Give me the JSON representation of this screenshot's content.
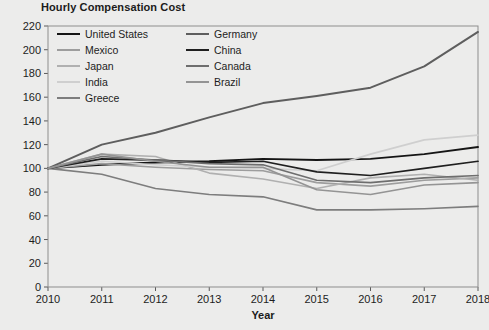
{
  "chart_data": {
    "type": "line",
    "title": "Hourly Compensation Cost",
    "xlabel": "Year",
    "ylabel": "",
    "x": [
      2010,
      2011,
      2012,
      2013,
      2014,
      2015,
      2016,
      2017,
      2018
    ],
    "xticklabels": [
      "2010",
      "2011",
      "2012",
      "2013",
      "2014",
      "2015",
      "2016",
      "2017",
      "2018"
    ],
    "xlim": [
      2010,
      2018
    ],
    "ylim": [
      0,
      220
    ],
    "yticks": [
      0,
      20,
      40,
      60,
      80,
      100,
      120,
      140,
      160,
      180,
      200,
      220
    ],
    "yticklabels": [
      "0",
      "20",
      "40",
      "60",
      "80",
      "100",
      "120",
      "140",
      "160",
      "180",
      "200",
      "220"
    ],
    "grid": false,
    "legend_position": "upper-left-inside",
    "legend_columns": 2,
    "series": [
      {
        "name": "United States",
        "color": "#151515",
        "width": 1.9,
        "values": [
          100,
          103,
          105,
          106,
          108,
          107,
          108,
          112,
          118
        ]
      },
      {
        "name": "Mexico",
        "color": "#9d9d9d",
        "width": 1.6,
        "values": [
          100,
          104,
          101,
          99,
          98,
          88,
          85,
          90,
          92
        ]
      },
      {
        "name": "Japan",
        "color": "#b0b0b0",
        "width": 1.6,
        "values": [
          100,
          112,
          110,
          96,
          91,
          83,
          92,
          95,
          90
        ]
      },
      {
        "name": "India",
        "color": "#cfcfcf",
        "width": 1.6,
        "values": [
          100,
          106,
          103,
          101,
          100,
          98,
          112,
          124,
          128
        ]
      },
      {
        "name": "Greece",
        "color": "#7d7d7d",
        "width": 1.6,
        "values": [
          100,
          95,
          83,
          78,
          76,
          65,
          65,
          66,
          68
        ]
      },
      {
        "name": "Germany",
        "color": "#5e5e5e",
        "width": 2.0,
        "values": [
          100,
          120,
          130,
          143,
          155,
          161,
          168,
          186,
          215
        ]
      },
      {
        "name": "China",
        "color": "#1f1f1f",
        "width": 1.7,
        "values": [
          100,
          108,
          107,
          105,
          106,
          97,
          94,
          100,
          106
        ]
      },
      {
        "name": "Canada",
        "color": "#6e6e6e",
        "width": 1.7,
        "values": [
          100,
          110,
          107,
          104,
          103,
          90,
          88,
          92,
          94
        ]
      },
      {
        "name": "Brazil",
        "color": "#949494",
        "width": 1.6,
        "values": [
          100,
          112,
          106,
          101,
          101,
          82,
          78,
          86,
          88
        ]
      }
    ]
  },
  "legend": {
    "items": [
      {
        "label": "United States"
      },
      {
        "label": "Mexico"
      },
      {
        "label": "Japan"
      },
      {
        "label": "India"
      },
      {
        "label": "Greece"
      },
      {
        "label": "Germany"
      },
      {
        "label": "China"
      },
      {
        "label": "Canada"
      },
      {
        "label": "Brazil"
      }
    ]
  },
  "colors": {
    "background": "#ececeb",
    "frame": "#8d8d8d",
    "text": "#1d1d1d"
  }
}
